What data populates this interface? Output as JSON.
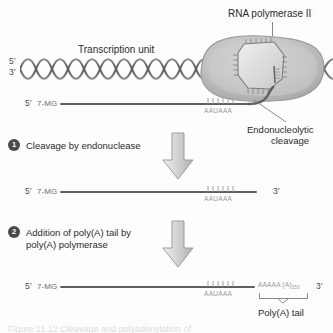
{
  "figure": {
    "title_label": "RNA polymerase II",
    "transcription_unit_label": "Transcription unit",
    "endonucleolytic_label_line1": "Endonucleolytic",
    "endonucleolytic_label_line2": "cleavage",
    "polya_tail_label": "Poly(A) tail",
    "caption_cut": "Figure 11.12  Cleavage and polyadenylation of"
  },
  "dna": {
    "five_prime": "5′",
    "three_prime": "3′"
  },
  "steps": [
    {
      "number": "1",
      "text": "Cleavage by endonuclease"
    },
    {
      "number": "2",
      "text": "Addition of poly(A) tail by\npoly(A) polymerase"
    }
  ],
  "transcripts": [
    {
      "id": "nascent",
      "five_prime": "5′",
      "cap": "7-MG",
      "signal": "AAUAAA",
      "three_prime": ""
    },
    {
      "id": "cleaved",
      "five_prime": "5′",
      "cap": "7-MG",
      "signal": "AAUAAA",
      "three_prime": "3′"
    },
    {
      "id": "polyadenylated",
      "five_prime": "5′",
      "cap": "7-MG",
      "signal": "AAUAAA",
      "polya": "AAAAA (A)",
      "polya_sub": "250",
      "three_prime": "3′"
    }
  ],
  "colors": {
    "rna_backbone": "#5f5f5f",
    "dna_strand": "#6b6b6b",
    "polymerase_fill": "#b8b8b8",
    "arrow_fill": "#cfcfcf",
    "text": "#2a2a2a",
    "sequence_text": "#9a9a9a"
  }
}
